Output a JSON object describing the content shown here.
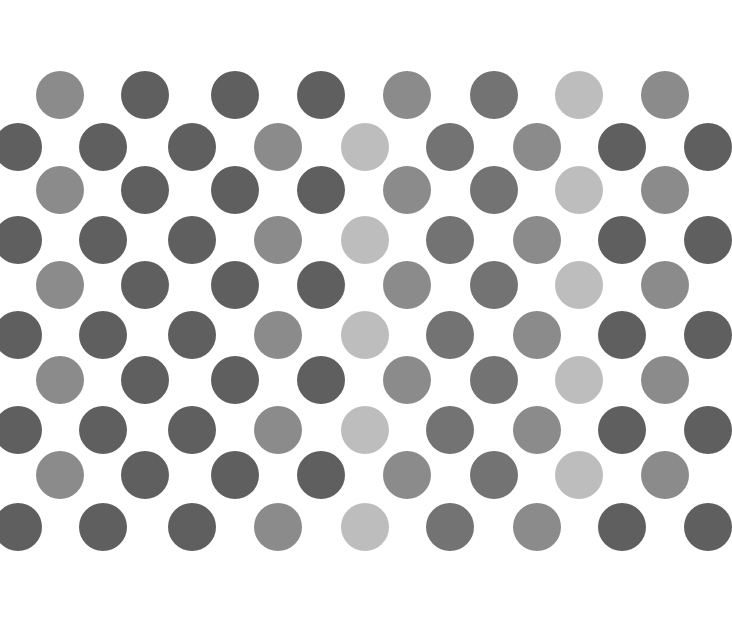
{
  "pattern": {
    "description": "Polka-dot grid of gray circles on white",
    "background": "#ffffff",
    "diameter": 48,
    "palette": {
      "dark": "#5f5f5f",
      "medium_dark": "#737373",
      "medium": "#8b8b8b",
      "light": "#bdbdbd"
    },
    "odd_rows": {
      "y": [
        95,
        190,
        285,
        380,
        475
      ],
      "x": [
        60,
        145,
        235,
        321,
        407,
        494,
        579,
        665
      ],
      "tones": [
        "medium",
        "dark",
        "dark",
        "dark",
        "medium",
        "medium_dark",
        "light",
        "medium"
      ]
    },
    "even_rows": {
      "y": [
        147,
        240,
        335,
        430,
        527
      ],
      "x": [
        18,
        103,
        192,
        278,
        365,
        450,
        537,
        622,
        708
      ],
      "tones": [
        "dark",
        "dark",
        "dark",
        "medium",
        "light",
        "medium_dark",
        "medium",
        "dark",
        "dark"
      ]
    }
  }
}
